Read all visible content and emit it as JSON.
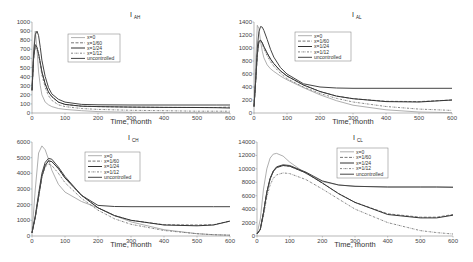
{
  "figure": {
    "legend_entries": [
      "x=0",
      "x=1/60",
      "x=1/24",
      "x=1/12",
      "uncontrolled"
    ],
    "series_styles": [
      {
        "name": "x=0",
        "color": "#9a9a9a",
        "dash": "",
        "width": 0.8
      },
      {
        "name": "x=1/60",
        "color": "#555555",
        "dash": "3,1.5",
        "width": 0.8
      },
      {
        "name": "x=1/24",
        "color": "#333333",
        "dash": "",
        "width": 1.0
      },
      {
        "name": "x=1/12",
        "color": "#666666",
        "dash": "2,1,0.5,1",
        "width": 0.8
      },
      {
        "name": "uncontrolled",
        "color": "#444444",
        "dash": "",
        "width": 1.0
      }
    ]
  },
  "chart_data": [
    {
      "type": "line",
      "title": "I",
      "title_sub": "AH",
      "xlabel": "Time, month",
      "ylabel": "",
      "xlim": [
        0,
        600
      ],
      "ylim": [
        0,
        1000
      ],
      "xticks": [
        0,
        100,
        200,
        300,
        400,
        500,
        600
      ],
      "yticks": [
        0,
        100,
        200,
        300,
        400,
        500,
        600,
        700,
        800,
        900,
        1000
      ],
      "grid": false,
      "legend_position": "upper center",
      "x": [
        0,
        5,
        10,
        15,
        20,
        25,
        30,
        40,
        50,
        60,
        80,
        100,
        150,
        200,
        300,
        400,
        500,
        560,
        600
      ],
      "series": [
        {
          "name": "x=0",
          "values": [
            250,
            700,
            900,
            700,
            450,
            300,
            200,
            120,
            90,
            70,
            50,
            40,
            25,
            15,
            8,
            5,
            3,
            3,
            3
          ]
        },
        {
          "name": "x=1/60",
          "values": [
            250,
            600,
            750,
            720,
            650,
            550,
            450,
            320,
            230,
            180,
            120,
            95,
            75,
            70,
            65,
            62,
            60,
            60,
            65
          ]
        },
        {
          "name": "x=1/24",
          "values": [
            250,
            600,
            750,
            720,
            650,
            550,
            450,
            320,
            230,
            180,
            120,
            95,
            75,
            70,
            65,
            62,
            60,
            58,
            55
          ]
        },
        {
          "name": "x=1/12",
          "values": [
            250,
            600,
            750,
            720,
            640,
            530,
            420,
            280,
            190,
            140,
            90,
            70,
            50,
            40,
            30,
            25,
            20,
            20,
            20
          ]
        },
        {
          "name": "uncontrolled",
          "values": [
            250,
            650,
            860,
            900,
            850,
            720,
            580,
            400,
            280,
            210,
            150,
            120,
            95,
            90,
            88,
            88,
            88,
            88,
            88
          ]
        }
      ]
    },
    {
      "type": "line",
      "title": "I",
      "title_sub": "AL",
      "xlabel": "Time, month",
      "ylabel": "",
      "xlim": [
        0,
        600
      ],
      "ylim": [
        0,
        1400
      ],
      "xticks": [
        0,
        100,
        200,
        300,
        400,
        500,
        600
      ],
      "yticks": [
        0,
        200,
        400,
        600,
        800,
        1000,
        1200,
        1400
      ],
      "grid": false,
      "legend_position": "upper left",
      "x": [
        0,
        5,
        10,
        15,
        20,
        25,
        30,
        40,
        50,
        60,
        80,
        100,
        150,
        200,
        250,
        300,
        400,
        500,
        600
      ],
      "series": [
        {
          "name": "x=0",
          "values": [
            100,
            800,
            1350,
            1300,
            1100,
            950,
            850,
            740,
            680,
            640,
            570,
            510,
            390,
            280,
            190,
            120,
            50,
            15,
            5
          ]
        },
        {
          "name": "x=1/60",
          "values": [
            100,
            500,
            900,
            1100,
            1120,
            1080,
            1020,
            920,
            830,
            760,
            650,
            570,
            430,
            330,
            260,
            220,
            180,
            175,
            200
          ]
        },
        {
          "name": "x=1/24",
          "values": [
            100,
            500,
            900,
            1100,
            1120,
            1080,
            1020,
            920,
            830,
            760,
            650,
            570,
            430,
            330,
            260,
            220,
            175,
            170,
            200
          ]
        },
        {
          "name": "x=1/12",
          "values": [
            100,
            500,
            900,
            1100,
            1110,
            1060,
            990,
            880,
            790,
            720,
            610,
            530,
            400,
            300,
            225,
            170,
            100,
            60,
            40
          ]
        },
        {
          "name": "uncontrolled",
          "values": [
            100,
            500,
            1000,
            1250,
            1330,
            1320,
            1270,
            1130,
            980,
            860,
            700,
            600,
            450,
            400,
            385,
            380,
            380,
            380,
            380
          ]
        }
      ]
    },
    {
      "type": "line",
      "title": "I",
      "title_sub": "CH",
      "xlabel": "Time, month",
      "ylabel": "",
      "xlim": [
        0,
        600
      ],
      "ylim": [
        0,
        6000
      ],
      "xticks": [
        0,
        100,
        200,
        300,
        400,
        500,
        600
      ],
      "yticks": [
        0,
        1000,
        2000,
        3000,
        4000,
        5000,
        6000
      ],
      "grid": false,
      "legend_position": "upper center",
      "x": [
        0,
        10,
        20,
        30,
        40,
        50,
        60,
        80,
        100,
        150,
        200,
        250,
        300,
        400,
        500,
        550,
        600
      ],
      "series": [
        {
          "name": "x=0",
          "values": [
            200,
            3000,
            5300,
            5750,
            5500,
            4900,
            4200,
            3300,
            2800,
            2200,
            1800,
            1300,
            900,
            400,
            150,
            80,
            50
          ]
        },
        {
          "name": "x=1/60",
          "values": [
            200,
            1200,
            2500,
            3800,
            4500,
            4800,
            4750,
            4300,
            3700,
            2600,
            1800,
            1300,
            1000,
            720,
            700,
            720,
            950
          ]
        },
        {
          "name": "x=1/24",
          "values": [
            200,
            1200,
            2500,
            3800,
            4500,
            4800,
            4750,
            4300,
            3700,
            2600,
            1800,
            1300,
            1000,
            700,
            650,
            700,
            950
          ]
        },
        {
          "name": "x=1/12",
          "values": [
            200,
            1200,
            2500,
            3800,
            4400,
            4600,
            4500,
            4000,
            3400,
            2400,
            1650,
            1100,
            750,
            350,
            150,
            80,
            50
          ]
        },
        {
          "name": "uncontrolled",
          "values": [
            200,
            1300,
            2700,
            4000,
            4700,
            4950,
            4900,
            4400,
            3800,
            2600,
            1950,
            1880,
            1870,
            1870,
            1870,
            1870,
            1870
          ]
        }
      ]
    },
    {
      "type": "line",
      "title": "I",
      "title_sub": "CL",
      "xlabel": "Time, month",
      "ylabel": "",
      "xlim": [
        0,
        600
      ],
      "ylim": [
        0,
        14000
      ],
      "xticks": [
        0,
        100,
        200,
        300,
        400,
        500,
        600
      ],
      "yticks": [
        0,
        2000,
        4000,
        6000,
        8000,
        10000,
        12000,
        14000
      ],
      "grid": false,
      "legend_position": "upper center",
      "x": [
        0,
        10,
        20,
        30,
        40,
        50,
        60,
        80,
        100,
        150,
        200,
        250,
        300,
        400,
        500,
        550,
        600
      ],
      "series": [
        {
          "name": "x=0",
          "values": [
            300,
            2500,
            7000,
            10000,
            11600,
            12200,
            12300,
            11900,
            11000,
            9300,
            8100,
            7600,
            7400,
            7300,
            7300,
            7300,
            7300
          ]
        },
        {
          "name": "x=1/60",
          "values": [
            300,
            1000,
            3500,
            6500,
            8500,
            9600,
            10200,
            10500,
            10400,
            9400,
            7900,
            6300,
            5000,
            3300,
            2800,
            2800,
            3200
          ]
        },
        {
          "name": "x=1/24",
          "values": [
            300,
            1000,
            3500,
            6500,
            8500,
            9600,
            10200,
            10500,
            10400,
            9400,
            7900,
            6300,
            5000,
            3200,
            2700,
            2700,
            3100
          ]
        },
        {
          "name": "x=1/12",
          "values": [
            300,
            900,
            3000,
            5800,
            7600,
            8600,
            9100,
            9400,
            9300,
            8400,
            7000,
            5500,
            4000,
            2000,
            800,
            500,
            300
          ]
        },
        {
          "name": "uncontrolled",
          "values": [
            300,
            1000,
            3500,
            6500,
            8600,
            9700,
            10300,
            10600,
            10500,
            9500,
            8200,
            7600,
            7400,
            7300,
            7300,
            7300,
            7250
          ]
        }
      ]
    }
  ],
  "panels": [
    {
      "box": [
        32,
        22,
        230,
        113
      ],
      "legend_box": [
        68,
        34,
        120,
        62
      ],
      "title_x": 131,
      "title_y": 17,
      "xlabel_y": 124
    },
    {
      "box": [
        254,
        22,
        452,
        113
      ],
      "legend_box": [
        295,
        32,
        351,
        61
      ],
      "title_x": 353,
      "title_y": 17,
      "xlabel_y": 124
    },
    {
      "box": [
        32,
        142,
        230,
        236
      ],
      "legend_box": [
        85,
        152,
        140,
        181
      ],
      "title_x": 129,
      "title_y": 140,
      "xlabel_y": 247
    },
    {
      "box": [
        257,
        142,
        453,
        236
      ],
      "legend_box": [
        337,
        148,
        388,
        178
      ],
      "title_x": 354,
      "title_y": 140,
      "xlabel_y": 247
    }
  ]
}
